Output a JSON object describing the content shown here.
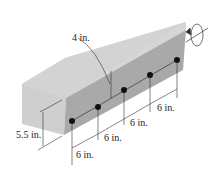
{
  "diagram": {
    "labels": {
      "rod_depth": "4 in.",
      "bottom_offset": "5.5 in.",
      "spacing_1": "6 in.",
      "spacing_2": "6 in.",
      "spacing_3": "6 in.",
      "spacing_4": "6 in."
    },
    "rod_count": 5,
    "colors": {
      "beam_top": "#d4d4d4",
      "beam_side": "#a8a8a8",
      "beam_end": "#c8c8c8",
      "rod": "#111111",
      "line": "#333333"
    }
  }
}
